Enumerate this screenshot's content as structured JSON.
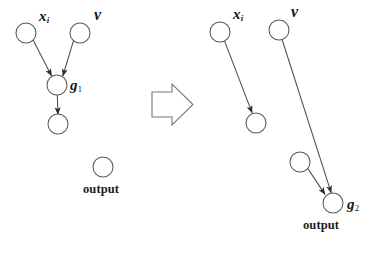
{
  "figure": {
    "kind": "computation-graph-transformation",
    "background_color": "#ffffff",
    "stroke_color": "#4e4e52",
    "node_fill": "#ffffff",
    "text_color": "#16161a",
    "width": 381,
    "height": 254
  },
  "transform_arrow": {
    "name": "block-arrow",
    "direction": "right",
    "label": ""
  },
  "left_panel": {
    "name": "before-graph",
    "nodes": [
      {
        "id": "L1",
        "label": "x",
        "sublabel": "i",
        "cx": 26,
        "cy": 33,
        "r": 10
      },
      {
        "id": "L2",
        "label": "v",
        "sublabel": "",
        "cx": 80,
        "cy": 33,
        "r": 10
      },
      {
        "id": "L3",
        "label": "g",
        "sublabel": "1",
        "cx": 57,
        "cy": 85,
        "r": 10
      },
      {
        "id": "L4",
        "label": "",
        "sublabel": "",
        "cx": 58,
        "cy": 124,
        "r": 10
      },
      {
        "id": "L5",
        "label": "output",
        "sublabel": "",
        "cx": 103,
        "cy": 167,
        "r": 10
      }
    ],
    "edges": [
      {
        "from": "L1",
        "to": "L3"
      },
      {
        "from": "L2",
        "to": "L3"
      },
      {
        "from": "L3",
        "to": "L4"
      }
    ],
    "labels": [
      {
        "name": "label-x-i",
        "text": "x",
        "sub": "i",
        "x": 39,
        "y": 9
      },
      {
        "name": "label-v",
        "text": "v",
        "sub": "",
        "x": 94,
        "y": 7
      },
      {
        "name": "label-g1",
        "text": "g",
        "sub": "1",
        "x": 70,
        "y": 78
      },
      {
        "name": "label-output",
        "text": "output",
        "sub": "",
        "x": 83,
        "y": 183
      }
    ]
  },
  "right_panel": {
    "name": "after-graph",
    "nodes": [
      {
        "id": "R1",
        "label": "x",
        "sublabel": "i",
        "cx": 220,
        "cy": 32,
        "r": 10
      },
      {
        "id": "R2",
        "label": "v",
        "sublabel": "",
        "cx": 279,
        "cy": 30,
        "r": 10
      },
      {
        "id": "R3",
        "label": "",
        "sublabel": "",
        "cx": 256,
        "cy": 123,
        "r": 10
      },
      {
        "id": "R4",
        "label": "",
        "sublabel": "",
        "cx": 300,
        "cy": 162,
        "r": 10
      },
      {
        "id": "R5",
        "label": "g",
        "sublabel": "2",
        "cx": 333,
        "cy": 203,
        "r": 10
      }
    ],
    "edges": [
      {
        "from": "R1",
        "to": "R3"
      },
      {
        "from": "R2",
        "to": "R5"
      },
      {
        "from": "R4",
        "to": "R5"
      }
    ],
    "labels": [
      {
        "name": "label-x-i",
        "text": "x",
        "sub": "i",
        "x": 233,
        "y": 7
      },
      {
        "name": "label-v",
        "text": "v",
        "sub": "",
        "x": 291,
        "y": 4
      },
      {
        "name": "label-g2",
        "text": "g",
        "sub": "2",
        "x": 347,
        "y": 197
      },
      {
        "name": "label-output",
        "text": "output",
        "sub": "",
        "x": 303,
        "y": 219
      }
    ]
  }
}
